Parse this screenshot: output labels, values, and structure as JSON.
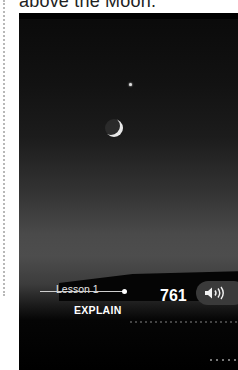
{
  "caption": {
    "text": "above the Moon."
  },
  "photo": {
    "subject": "crescent moon and star over horizon at dusk"
  },
  "footer": {
    "lesson_label": "Lesson 1",
    "section_label": "EXPLAIN",
    "page_number": "761",
    "audio_button_icon": "speaker-icon"
  }
}
